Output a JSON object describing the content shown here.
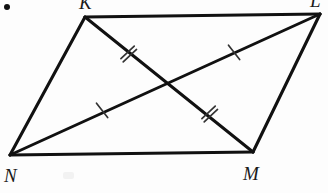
{
  "figure": {
    "kind": "geometry-diagram",
    "shape": "parallelogram",
    "name": "KLMN",
    "stroke_color": "#111111",
    "tick_color": "#333333",
    "background_color": "#fdfdfd",
    "width": 328,
    "height": 193,
    "vertices": [
      {
        "id": "K",
        "label": "K",
        "x": 85,
        "y": 17,
        "label_x": 79,
        "label_y": -7,
        "clipped_by_top_edge": true
      },
      {
        "id": "L",
        "label": "L",
        "x": 320,
        "y": 14,
        "label_x": 310,
        "label_y": -9,
        "clipped_by_top_edge": true
      },
      {
        "id": "M",
        "label": "M",
        "x": 253,
        "y": 152,
        "label_x": 243,
        "label_y": 164,
        "clipped_by_top_edge": false
      },
      {
        "id": "N",
        "label": "N",
        "x": 10,
        "y": 155,
        "label_x": 4,
        "label_y": 166,
        "clipped_by_top_edge": false
      }
    ],
    "edges": [
      {
        "id": "KL",
        "from": "K",
        "to": "L"
      },
      {
        "id": "LM",
        "from": "L",
        "to": "M"
      },
      {
        "id": "MN",
        "from": "M",
        "to": "N"
      },
      {
        "id": "NK",
        "from": "N",
        "to": "K"
      }
    ],
    "diagonals": [
      {
        "id": "KM",
        "from": "K",
        "to": "M",
        "tick_count": 2
      },
      {
        "id": "NL",
        "from": "N",
        "to": "L",
        "tick_count": 1
      }
    ],
    "intersection": {
      "id": "P",
      "x": 168,
      "y": 87,
      "labeled": false
    },
    "tick_marks": [
      {
        "id": "tick-km-upper",
        "on_segment": "KM",
        "count": 2,
        "x": 128,
        "y": 53,
        "angle_deg": 55
      },
      {
        "id": "tick-km-lower",
        "on_segment": "KM",
        "count": 2,
        "x": 209,
        "y": 113,
        "angle_deg": 55
      },
      {
        "id": "tick-nl-lower",
        "on_segment": "NL",
        "count": 1,
        "x": 101,
        "y": 111,
        "angle_deg": -30
      },
      {
        "id": "tick-nl-upper",
        "on_segment": "NL",
        "count": 1,
        "x": 233,
        "y": 53,
        "angle_deg": -30
      }
    ],
    "marks": [
      {
        "id": "corner-dot",
        "kind": "bullet-dot",
        "x": 7,
        "y": 7
      },
      {
        "id": "scan-smudge",
        "kind": "scan-artifact",
        "x": 63,
        "y": 172
      }
    ]
  }
}
